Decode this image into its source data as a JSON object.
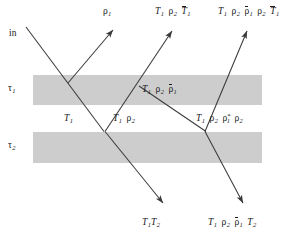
{
  "figure": {
    "background": "#ffffff",
    "width": 293,
    "height": 238,
    "ray_color": "#3a3a3a",
    "slab_color": "#cccccc"
  },
  "slabs": [
    {
      "name": "tau-1",
      "label": "τ",
      "subscript": "1",
      "x": 33,
      "y": 75,
      "width": 229,
      "height": 30
    },
    {
      "name": "tau-2",
      "label": "τ",
      "subscript": "2",
      "x": 33,
      "y": 132,
      "width": 229,
      "height": 31
    }
  ],
  "labels": {
    "incident": "in",
    "reflected_first": {
      "rho": "ρ",
      "sub": "1"
    },
    "top_second": {
      "parts": [
        "T",
        "1",
        "ρ",
        "2",
        "T̄",
        "1"
      ]
    },
    "top_third": {
      "parts": [
        "T",
        "1",
        "ρ",
        "2",
        "ρ̄1",
        "ρ",
        "2",
        "T̄1"
      ]
    },
    "mid_interior": {
      "parts": [
        "T",
        "1",
        "ρ",
        "2",
        "ρ̄",
        "1"
      ]
    },
    "gap_left": {
      "parts": [
        "T",
        "1"
      ]
    },
    "gap_mid": {
      "parts": [
        "T",
        "1",
        "ρ",
        "2"
      ]
    },
    "gap_right": {
      "parts": [
        "T",
        "1",
        "ρ",
        "2",
        "ρ",
        "1",
        "*",
        "ρ",
        "2"
      ]
    },
    "bottom_left": {
      "parts": [
        "T",
        "1",
        "T",
        "2"
      ]
    },
    "bottom_right": {
      "parts": [
        "T",
        "1",
        "ρ",
        "2",
        "ρ̄",
        "1",
        "T",
        "2"
      ]
    }
  },
  "label_text": {
    "incident": "in",
    "rho1": "ρ1",
    "t1_rho2_t1bar": "T1 ρ2 T̄1",
    "t1_rho2_rho1bar_rho2_t1bar": "T1 ρ2 ρ̄1 ρ2 T̄1",
    "t1_rho2_rho1bar": "T1 ρ2 ρ̄1",
    "t1": "T1",
    "t1_rho2": "T1 ρ2",
    "t1_rho2_rho1star_rho2": "T1 ρ2 ρ1* ρ2",
    "t1_t2": "T1T2",
    "t1_rho2_rho1bar_t2": "T1 ρ2 ρ̄1 T2"
  },
  "rays": [
    {
      "name": "incident-ray",
      "from": [
        28,
        28
      ],
      "to": [
        68,
        75
      ],
      "arrow": false
    },
    {
      "name": "reflected-ray-rho1",
      "from": [
        68,
        75
      ],
      "to": [
        110,
        28
      ],
      "arrow": true
    },
    {
      "name": "transmitted-ray-into-layer1",
      "from": [
        68,
        75
      ],
      "to": [
        105,
        132
      ],
      "arrow": true
    },
    {
      "name": "transmitted-ray-through-layer2",
      "from": [
        105,
        132
      ],
      "to": [
        165,
        205
      ],
      "arrow": true
    },
    {
      "name": "internal-reflection-upward-1",
      "from": [
        105,
        132
      ],
      "to": [
        168,
        28
      ],
      "arrow": true
    },
    {
      "name": "internal-reflection-downward",
      "from": [
        140,
        90
      ],
      "to": [
        205,
        132
      ],
      "arrow": false
    },
    {
      "name": "second-internal-up",
      "from": [
        205,
        132
      ],
      "to": [
        243,
        28
      ],
      "arrow": true
    },
    {
      "name": "second-transmitted-down",
      "from": [
        205,
        132
      ],
      "to": [
        242,
        205
      ],
      "arrow": true
    }
  ]
}
